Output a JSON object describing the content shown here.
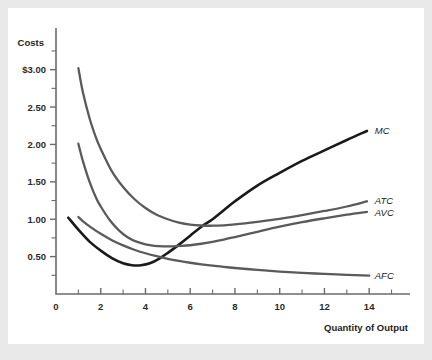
{
  "figure": {
    "background_color": "#e9e9e9",
    "panel_color": "#ffffff",
    "y_axis_title": "Costs",
    "x_axis_title": "Quantity of Output"
  },
  "chart_data": {
    "type": "line",
    "title": "",
    "xlabel": "Quantity of Output",
    "ylabel": "Costs",
    "xlim": [
      0,
      15.2
    ],
    "ylim": [
      0,
      3.45
    ],
    "xticks": [
      0,
      2,
      4,
      6,
      8,
      10,
      12,
      14
    ],
    "xticklabels": [
      "0",
      "2",
      "4",
      "6",
      "8",
      "10",
      "12",
      "14"
    ],
    "xticks_minor": [
      1,
      3,
      5,
      7,
      9,
      11,
      13,
      15
    ],
    "yticks": [
      0.5,
      1.0,
      1.5,
      2.0,
      2.5,
      3.0
    ],
    "yticklabels": [
      "0.50",
      "1.00",
      "1.50",
      "2.00",
      "2.50",
      "$3.00"
    ],
    "yticks_minor": [
      0.25,
      0.75,
      1.25,
      1.75,
      2.25,
      2.75,
      3.25
    ],
    "grid": false,
    "legend_position": "right-inline",
    "series": [
      {
        "name": "MC",
        "label": "MC",
        "color": "#1a1a1a",
        "linewidth": 2.6,
        "x": [
          0.55,
          1.0,
          1.5,
          2.0,
          2.5,
          3.0,
          3.4,
          3.8,
          4.2,
          4.6,
          5.0,
          5.5,
          6.0,
          6.5,
          7.0,
          7.5,
          8.0,
          9.0,
          10.0,
          11.0,
          12.0,
          13.0,
          13.9
        ],
        "y": [
          1.02,
          0.86,
          0.7,
          0.58,
          0.48,
          0.41,
          0.385,
          0.385,
          0.41,
          0.47,
          0.55,
          0.66,
          0.78,
          0.9,
          1.0,
          1.12,
          1.24,
          1.45,
          1.62,
          1.78,
          1.92,
          2.06,
          2.18
        ]
      },
      {
        "name": "ATC",
        "label": "ATC",
        "color": "#5a5a5a",
        "linewidth": 2.3,
        "x": [
          1.0,
          1.2,
          1.5,
          1.8,
          2.0,
          2.5,
          3.0,
          3.5,
          4.0,
          4.5,
          5.0,
          5.5,
          6.0,
          6.5,
          7.0,
          7.5,
          8.0,
          9.0,
          10.0,
          11.0,
          12.0,
          13.0,
          13.9
        ],
        "y": [
          3.02,
          2.7,
          2.35,
          2.08,
          1.94,
          1.64,
          1.43,
          1.27,
          1.15,
          1.06,
          1.0,
          0.955,
          0.928,
          0.916,
          0.913,
          0.918,
          0.93,
          0.965,
          1.005,
          1.055,
          1.11,
          1.17,
          1.24
        ]
      },
      {
        "name": "AVC",
        "label": "AVC",
        "color": "#5a5a5a",
        "linewidth": 2.3,
        "x": [
          1.0,
          1.2,
          1.5,
          1.8,
          2.0,
          2.4,
          2.8,
          3.2,
          3.6,
          4.0,
          4.4,
          4.8,
          5.2,
          5.6,
          6.0,
          6.5,
          7.0,
          7.5,
          8.0,
          9.0,
          10.0,
          11.0,
          12.0,
          13.0,
          13.9
        ],
        "y": [
          2.01,
          1.78,
          1.5,
          1.28,
          1.17,
          0.99,
          0.855,
          0.76,
          0.7,
          0.665,
          0.645,
          0.638,
          0.638,
          0.643,
          0.652,
          0.672,
          0.698,
          0.728,
          0.762,
          0.832,
          0.9,
          0.96,
          1.012,
          1.06,
          1.098
        ]
      },
      {
        "name": "AFC",
        "label": "AFC",
        "color": "#5a5a5a",
        "linewidth": 2.3,
        "x": [
          1.0,
          1.2,
          1.5,
          2.0,
          2.5,
          3.0,
          3.5,
          4.0,
          4.5,
          5.0,
          5.5,
          6.0,
          6.5,
          7.0,
          7.5,
          8.0,
          9.0,
          10.0,
          11.0,
          12.0,
          13.0,
          14.0
        ],
        "y": [
          1.03,
          0.975,
          0.905,
          0.805,
          0.72,
          0.65,
          0.592,
          0.545,
          0.505,
          0.47,
          0.442,
          0.418,
          0.397,
          0.378,
          0.362,
          0.348,
          0.322,
          0.3,
          0.283,
          0.268,
          0.256,
          0.246
        ]
      }
    ],
    "annotations": [
      {
        "text": "MC",
        "x": 14.25,
        "y": 2.19
      },
      {
        "text": "ATC",
        "x": 14.25,
        "y": 1.255
      },
      {
        "text": "AVC",
        "x": 14.25,
        "y": 1.095
      },
      {
        "text": "AFC",
        "x": 14.25,
        "y": 0.245
      }
    ]
  }
}
